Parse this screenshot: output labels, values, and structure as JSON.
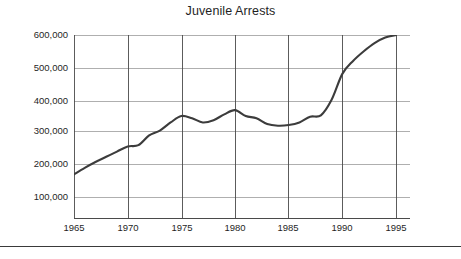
{
  "chart_data": {
    "type": "line",
    "title": "Juvenile Arrests",
    "xlabel": "",
    "ylabel": "",
    "xlim": [
      1965,
      1995
    ],
    "ylim": [
      0,
      600000
    ],
    "grid": true,
    "legend": "none",
    "y_ticks": [
      100000,
      200000,
      300000,
      400000,
      500000,
      600000
    ],
    "y_tick_labels": [
      "100,000",
      "200,000",
      "300,000",
      "400,000",
      "500,000",
      "600,000"
    ],
    "x_ticks": [
      1965,
      1970,
      1975,
      1980,
      1985,
      1990,
      1995
    ],
    "x_tick_labels": [
      "1965",
      "1970",
      "1975",
      "1980",
      "1985",
      "1990",
      "1995"
    ],
    "series": [
      {
        "name": "Juvenile Arrests",
        "color": "#3c3c3c",
        "x": [
          1965,
          1966,
          1967,
          1968,
          1969,
          1970,
          1971,
          1972,
          1973,
          1974,
          1975,
          1976,
          1977,
          1978,
          1979,
          1980,
          1981,
          1982,
          1983,
          1984,
          1985,
          1986,
          1987,
          1988,
          1989,
          1990,
          1991,
          1992,
          1993,
          1994,
          1995
        ],
        "values": [
          170000,
          190000,
          208000,
          224000,
          240000,
          256000,
          260000,
          290000,
          305000,
          330000,
          350000,
          343000,
          330000,
          337000,
          355000,
          368000,
          350000,
          343000,
          325000,
          320000,
          322000,
          330000,
          348000,
          352000,
          400000,
          480000,
          520000,
          550000,
          575000,
          592000,
          600000
        ]
      }
    ]
  },
  "axes": {
    "y_tick_positions_px": [
      197,
      164,
      131,
      101,
      68,
      35
    ],
    "x_tick_positions_px": [
      74,
      128,
      182,
      235,
      288,
      342,
      396
    ]
  },
  "colors": {
    "line": "#3c3c3c",
    "axis": "#4a4a4a",
    "grid": "#8c8c8c",
    "text": "#1f1f1f",
    "background": "#ffffff",
    "rule": "#3a3a3a"
  }
}
